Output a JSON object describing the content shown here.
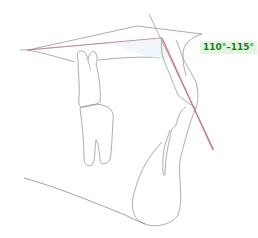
{
  "diagram": {
    "type": "cephalometric-tracing",
    "angle_label": "110°–115°",
    "colors": {
      "outline": "#8a8a8a",
      "reference_line": "#d06a78",
      "label_text": "#1f7a1f",
      "label_bg": "#e4f6e2"
    }
  }
}
